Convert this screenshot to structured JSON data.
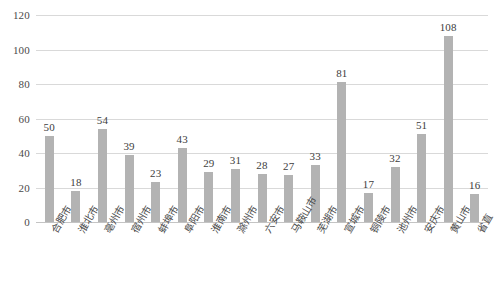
{
  "chart_data": {
    "type": "bar",
    "title": "",
    "xlabel": "",
    "ylabel": "",
    "ylim": [
      0,
      120
    ],
    "yticks": [
      0,
      20,
      40,
      60,
      80,
      100,
      120
    ],
    "grid": true,
    "legend": null,
    "bar_color": "#b3b3b3",
    "gridline_color": "#d9d9d9",
    "categories": [
      "合肥市",
      "淮北市",
      "亳州市",
      "宿州市",
      "蚌埠市",
      "阜阳市",
      "淮南市",
      "滁州市",
      "六安市",
      "马鞍山市",
      "芜湖市",
      "宣城市",
      "铜陵市",
      "池州市",
      "安庆市",
      "黄山市",
      "省直"
    ],
    "values": [
      50,
      18,
      54,
      39,
      23,
      43,
      29,
      31,
      28,
      27,
      33,
      81,
      17,
      32,
      51,
      108,
      16
    ]
  }
}
